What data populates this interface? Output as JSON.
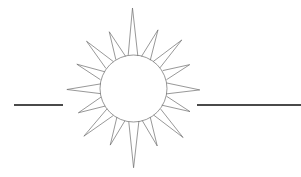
{
  "canvas": {
    "width": 301,
    "height": 177,
    "background_color": "#ffffff",
    "description": "Hand-drawn sun burst symbol with sixteen pointed rays around an open circle, flanked left and right by horizontal rule segments"
  },
  "sun": {
    "label": "sun-burst-symbol",
    "center_x": 133.5,
    "center_y": 88.5,
    "core_radius": 33.5,
    "ray_count": 16,
    "stroke_color": "#6b6b6b",
    "stroke_width": 0.7,
    "fill_color": "none",
    "ray_tip_radii": [
      79.0,
      62.0,
      68.0,
      61.0,
      67.0,
      60.0,
      69.0,
      62.0,
      79.0,
      61.0,
      68.0,
      60.0,
      67.0,
      61.0,
      68.0,
      62.0
    ],
    "ray_half_angle_deg": 8.5,
    "start_angle_deg": -90
  },
  "rules": {
    "left": {
      "label": "left-rule",
      "x1": 14,
      "y1": 105,
      "x2": 63,
      "y2": 105,
      "color": "#4a4a4a",
      "thickness": 2.2
    },
    "right": {
      "label": "right-rule",
      "x1": 197,
      "y1": 105,
      "x2": 301,
      "y2": 105,
      "color": "#4a4a4a",
      "thickness": 2.2
    }
  }
}
